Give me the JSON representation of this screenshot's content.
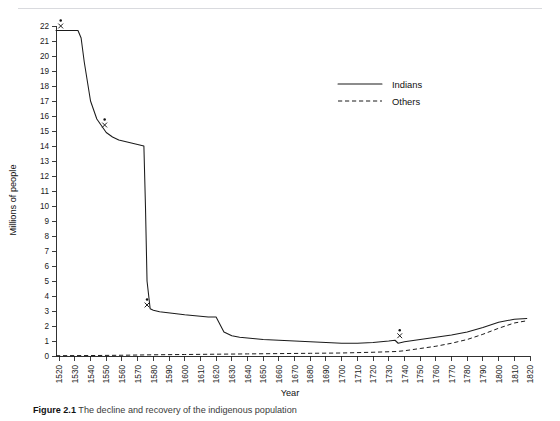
{
  "figure": {
    "caption_label": "Figure 2.1",
    "caption_text": "The decline and recovery of the indigenous population"
  },
  "chart_data": {
    "type": "line",
    "title": "",
    "xlabel": "Year",
    "ylabel": "Millions of people",
    "xlim": [
      1518,
      1820
    ],
    "ylim": [
      0,
      22
    ],
    "grid": false,
    "legend_position": "top-right",
    "y_ticks": [
      0,
      1,
      2,
      3,
      4,
      5,
      6,
      7,
      8,
      9,
      10,
      11,
      12,
      13,
      14,
      15,
      16,
      17,
      18,
      19,
      20,
      21,
      22
    ],
    "x_ticks": [
      1520,
      1530,
      1540,
      1550,
      1560,
      1570,
      1580,
      1590,
      1600,
      1610,
      1620,
      1630,
      1640,
      1650,
      1660,
      1670,
      1680,
      1690,
      1700,
      1710,
      1720,
      1730,
      1740,
      1750,
      1760,
      1770,
      1780,
      1790,
      1800,
      1810,
      1820
    ],
    "series": [
      {
        "name": "Indians",
        "style": "solid",
        "color": "#1b1b1b",
        "x": [
          1518,
          1532,
          1534,
          1536,
          1540,
          1544,
          1548,
          1550,
          1554,
          1558,
          1562,
          1566,
          1570,
          1574,
          1575,
          1576,
          1578,
          1580,
          1584,
          1588,
          1592,
          1596,
          1600,
          1605,
          1610,
          1615,
          1620,
          1625,
          1630,
          1635,
          1640,
          1645,
          1650,
          1660,
          1670,
          1680,
          1690,
          1700,
          1710,
          1720,
          1730,
          1734,
          1736,
          1740,
          1750,
          1760,
          1770,
          1780,
          1790,
          1800,
          1810,
          1818
        ],
        "y": [
          21.7,
          21.7,
          21.2,
          19.6,
          17.0,
          15.8,
          15.2,
          14.9,
          14.6,
          14.4,
          14.3,
          14.2,
          14.1,
          14.0,
          10.0,
          5.0,
          3.15,
          3.05,
          2.95,
          2.9,
          2.85,
          2.8,
          2.75,
          2.7,
          2.65,
          2.6,
          2.6,
          1.6,
          1.35,
          1.25,
          1.2,
          1.15,
          1.1,
          1.05,
          1.0,
          0.95,
          0.9,
          0.85,
          0.85,
          0.9,
          1.0,
          1.05,
          0.85,
          0.95,
          1.1,
          1.25,
          1.4,
          1.6,
          1.9,
          2.25,
          2.45,
          2.5
        ]
      },
      {
        "name": "Others",
        "style": "dashed",
        "color": "#1b1b1b",
        "x": [
          1518,
          1540,
          1560,
          1580,
          1600,
          1620,
          1640,
          1660,
          1680,
          1700,
          1720,
          1735,
          1740,
          1750,
          1760,
          1770,
          1780,
          1790,
          1800,
          1810,
          1818
        ],
        "y": [
          0.02,
          0.03,
          0.05,
          0.08,
          0.1,
          0.12,
          0.14,
          0.16,
          0.18,
          0.2,
          0.25,
          0.3,
          0.35,
          0.5,
          0.65,
          0.85,
          1.1,
          1.45,
          1.85,
          2.2,
          2.35
        ]
      }
    ],
    "annotations": [
      {
        "name": "marker-1518",
        "x": 1521,
        "y": 22.0,
        "symbol": "x-with-dot"
      },
      {
        "name": "marker-1548",
        "x": 1549,
        "y": 15.4,
        "symbol": "x-with-dot"
      },
      {
        "name": "marker-1575",
        "x": 1576,
        "y": 3.4,
        "symbol": "x-with-dot"
      },
      {
        "name": "marker-1735",
        "x": 1737,
        "y": 1.35,
        "symbol": "x-with-dot"
      }
    ],
    "legend": [
      {
        "label": "Indians",
        "style": "solid"
      },
      {
        "label": "Others",
        "style": "dashed"
      }
    ]
  }
}
